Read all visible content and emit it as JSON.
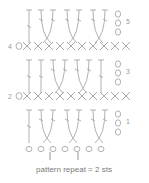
{
  "colors": {
    "stitch": "#a8a8a8",
    "text": "#8a8a8a",
    "background": "#ffffff"
  },
  "legend": {
    "repeat_text": "pattern repeat = 2 sts"
  },
  "foundation_chain_count": 7,
  "rows": [
    {
      "number": "1",
      "type": "dc-cross",
      "side": "right",
      "turning_chains": 3
    },
    {
      "number": "2",
      "type": "sc",
      "side": "left",
      "count": 10
    },
    {
      "number": "3",
      "type": "dc-cross",
      "side": "right",
      "turning_chains": 3
    },
    {
      "number": "4",
      "type": "sc",
      "side": "left",
      "count": 10
    },
    {
      "number": "5",
      "type": "dc-cross",
      "side": "right",
      "turning_chains": 3
    }
  ],
  "row_labels": {
    "r1": "1",
    "r2": "2",
    "r3": "3",
    "r4": "4",
    "r5": "5",
    "ch_left": "0"
  }
}
